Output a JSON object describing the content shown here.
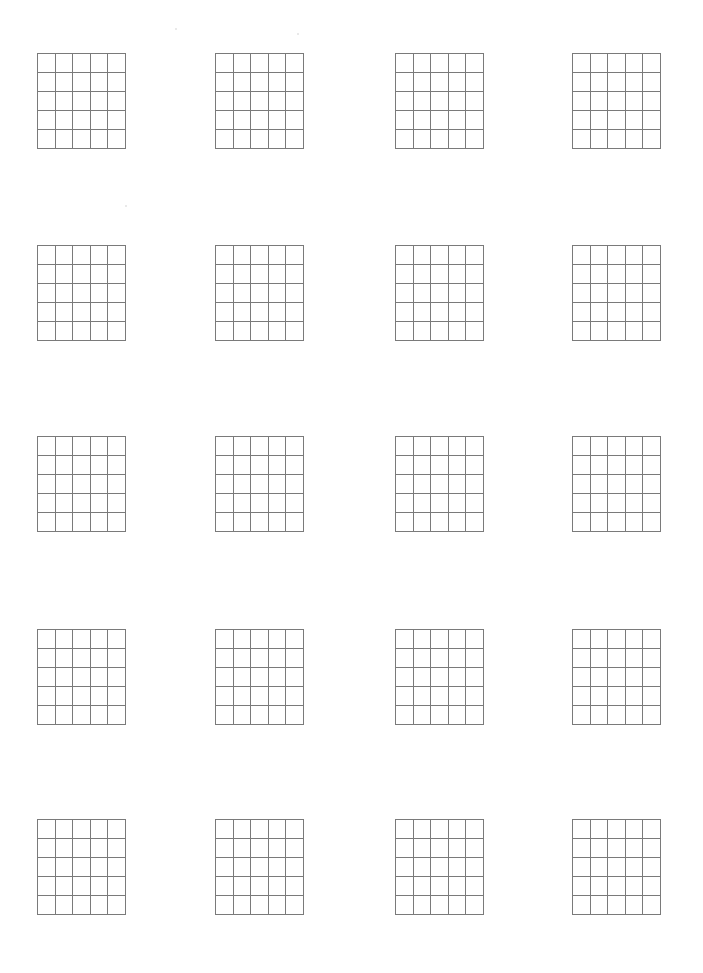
{
  "page": {
    "type": "blank-grid-worksheet",
    "background_color": "#ffffff",
    "line_color": "#7a7a7a"
  },
  "grid_layout": {
    "rows_of_grids": 5,
    "cols_of_grids": 4,
    "cells_per_grid": {
      "rows": 5,
      "cols": 5
    },
    "col_x": [
      37,
      215,
      395,
      572
    ],
    "row_y": [
      53,
      245,
      436,
      629,
      819
    ],
    "grid_width": 89,
    "grid_height": 96
  },
  "grids": [
    {
      "id": "grid-r1-c1"
    },
    {
      "id": "grid-r1-c2"
    },
    {
      "id": "grid-r1-c3"
    },
    {
      "id": "grid-r1-c4"
    },
    {
      "id": "grid-r2-c1"
    },
    {
      "id": "grid-r2-c2"
    },
    {
      "id": "grid-r2-c3"
    },
    {
      "id": "grid-r2-c4"
    },
    {
      "id": "grid-r3-c1"
    },
    {
      "id": "grid-r3-c2"
    },
    {
      "id": "grid-r3-c3"
    },
    {
      "id": "grid-r3-c4"
    },
    {
      "id": "grid-r4-c1"
    },
    {
      "id": "grid-r4-c2"
    },
    {
      "id": "grid-r4-c3"
    },
    {
      "id": "grid-r4-c4"
    },
    {
      "id": "grid-r5-c1"
    },
    {
      "id": "grid-r5-c2"
    },
    {
      "id": "grid-r5-c3"
    },
    {
      "id": "grid-r5-c4"
    }
  ]
}
